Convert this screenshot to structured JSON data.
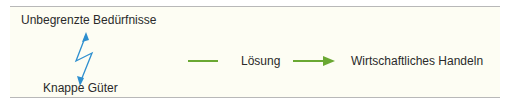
{
  "diagram": {
    "needs": "Unbegrenzte Bedürfnisse",
    "goods": "Knappe Güter",
    "solution": "Lösung",
    "result": "Wirtschaftliches Handeln",
    "colors": {
      "background": "#fdfdf3",
      "border": "#b8b8b8",
      "bolt": "#2e8fcf",
      "arrow": "#6aa832",
      "text": "#2a2a2a"
    }
  }
}
